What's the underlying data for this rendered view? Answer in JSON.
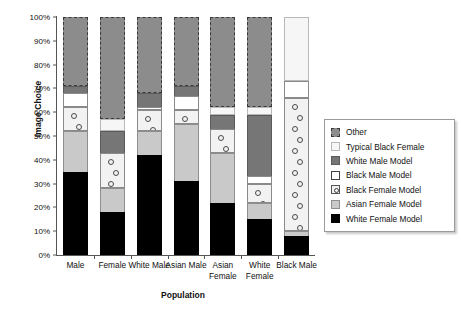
{
  "chart_data": {
    "type": "bar",
    "title": "",
    "xlabel": "Population",
    "ylabel": "Image Choice",
    "ylim": [
      0,
      100
    ],
    "stacked": true,
    "stack_total": 100,
    "grid": false,
    "legend_position": "right",
    "categories": [
      "Male",
      "Female",
      "White Male",
      "Asian Male",
      "Asian Female",
      "White Female",
      "Black Male"
    ],
    "ytick_labels": [
      "0%",
      "10%",
      "20%",
      "30%",
      "40%",
      "50%",
      "60%",
      "70%",
      "80%",
      "90%",
      "100%"
    ],
    "ytick_values": [
      0,
      10,
      20,
      30,
      40,
      50,
      60,
      70,
      80,
      90,
      100
    ],
    "series": [
      {
        "name": "White Female Model",
        "key": "white-female",
        "values": [
          35,
          18,
          42,
          31,
          22,
          15,
          8
        ]
      },
      {
        "name": "Asian Female Model",
        "key": "asian-female",
        "values": [
          17,
          10,
          10,
          24,
          21,
          7,
          2
        ]
      },
      {
        "name": "Black Female Model",
        "key": "black-female",
        "values": [
          10,
          15,
          9,
          6,
          10,
          8,
          56
        ]
      },
      {
        "name": "Black Male Model",
        "key": "black-male",
        "values": [
          6,
          0,
          1,
          6,
          0,
          3,
          7
        ]
      },
      {
        "name": "White Male Model",
        "key": "white-male",
        "values": [
          3,
          9,
          6,
          4,
          6,
          26,
          0
        ]
      },
      {
        "name": "Typical Black Female",
        "key": "typical-black-female",
        "values": [
          0,
          5,
          0,
          0,
          3,
          3,
          27
        ]
      },
      {
        "name": "Other",
        "key": "other",
        "values": [
          29,
          43,
          32,
          29,
          38,
          38,
          0
        ]
      }
    ]
  },
  "legend": {
    "items": [
      {
        "label": "Other",
        "swatch": "sw-other"
      },
      {
        "label": "Typical Black Female",
        "swatch": "sw-typical"
      },
      {
        "label": "White Male Model",
        "swatch": "sw-whitemale"
      },
      {
        "label": "Black Male Model",
        "swatch": "sw-blackmale"
      },
      {
        "label": "Black Female Model",
        "swatch": "sw-blackfem"
      },
      {
        "label": "Asian Female Model",
        "swatch": "sw-asianfem"
      },
      {
        "label": "White Female Model",
        "swatch": "sw-whitefem"
      }
    ]
  }
}
